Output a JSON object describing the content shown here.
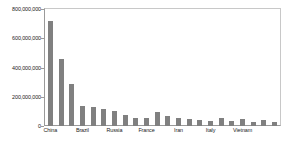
{
  "chart_data": {
    "type": "bar",
    "title": "",
    "subtitle": "",
    "xlabel": "",
    "ylabel": "",
    "ylim": [
      0,
      800000000
    ],
    "grid": false,
    "legend": null,
    "bar_color": "#808080",
    "axis_color": "#9a9a9a",
    "y_ticks": [
      0,
      200000000,
      400000000,
      600000000,
      800000000
    ],
    "y_tick_labels": [
      "0",
      "200,000,000",
      "400,000,000",
      "600,000,000",
      "800,000,000"
    ],
    "categories": [
      "China",
      "",
      "",
      "Brazil",
      "",
      "",
      "Russia",
      "",
      "",
      "France",
      "",
      "",
      "Iran",
      "",
      "",
      "Italy",
      "",
      "",
      "Vietnam",
      "",
      "",
      ""
    ],
    "visible_x_tick_labels": [
      "China",
      "Brazil",
      "Russia",
      "France",
      "Iran",
      "Italy",
      "Vietnam"
    ],
    "values": [
      720000000,
      460000000,
      288000000,
      140000000,
      132000000,
      115000000,
      105000000,
      72000000,
      58000000,
      58000000,
      96000000,
      70000000,
      55000000,
      48000000,
      40000000,
      35000000,
      52000000,
      33000000,
      48000000,
      30000000,
      38000000,
      30000000
    ]
  }
}
